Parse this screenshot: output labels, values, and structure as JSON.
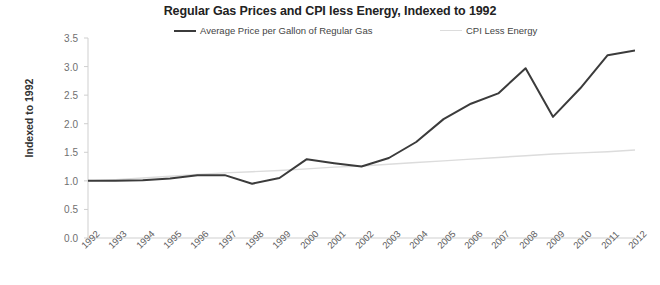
{
  "chart_data": {
    "type": "line",
    "title": "Regular Gas Prices and CPI less Energy, Indexed to 1992",
    "xlabel": "",
    "ylabel": "Indexed to 1992",
    "ylim": [
      0.0,
      3.5
    ],
    "ytick_labels": [
      "3.5",
      "3.0",
      "2.5",
      "2.0",
      "1.5",
      "1.0",
      "0.5",
      "0.0"
    ],
    "yticks": [
      3.5,
      3.0,
      2.5,
      2.0,
      1.5,
      1.0,
      0.5,
      0.0
    ],
    "grid": false,
    "legend_position": "top-center",
    "categories": [
      "1992",
      "1993",
      "1994",
      "1995",
      "1996",
      "1997",
      "1998",
      "1999",
      "2000",
      "2001",
      "2002",
      "2003",
      "2004",
      "2005",
      "2006",
      "2007",
      "2008",
      "2009",
      "2010",
      "2011",
      "2012"
    ],
    "series": [
      {
        "name": "Average Price per Gallon of Regular Gas",
        "color": "#3b3b3b",
        "values": [
          1.0,
          1.0,
          1.01,
          1.04,
          1.1,
          1.1,
          0.95,
          1.05,
          1.38,
          1.31,
          1.25,
          1.4,
          1.68,
          2.08,
          2.35,
          2.53,
          2.97,
          2.12,
          2.62,
          3.2,
          3.28
        ]
      },
      {
        "name": "CPI Less Energy",
        "color": "#dcdcdc",
        "values": [
          1.0,
          1.02,
          1.05,
          1.08,
          1.11,
          1.14,
          1.16,
          1.18,
          1.21,
          1.24,
          1.26,
          1.29,
          1.32,
          1.35,
          1.38,
          1.41,
          1.44,
          1.47,
          1.49,
          1.51,
          1.54
        ]
      }
    ]
  },
  "legend": {
    "gas_label": "Average Price per Gallon of Regular Gas",
    "cpi_label": "CPI Less Energy"
  }
}
